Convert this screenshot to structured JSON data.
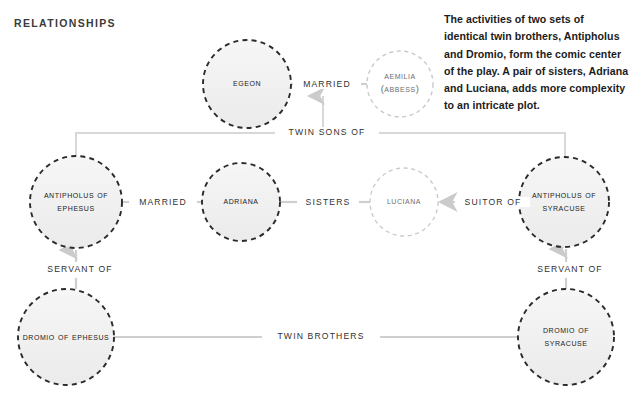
{
  "page": {
    "title": "RELATIONSHIPS",
    "background": "#ffffff",
    "width": 634,
    "height": 397
  },
  "blurb": {
    "text": "The activities of two sets of identical twin brothers, Antipholus and Dromio, form the comic center of the play. A pair of sisters, Adriana and Luciana, adds more complexity to an intricate plot."
  },
  "colors": {
    "node_fill": "#f1f1f1",
    "node_stroke_strong": "#2b2b2b",
    "node_stroke_faint": "#c9c9c9",
    "edge_stroke": "#cfcfcf",
    "text": "#222222",
    "text_faint": "#6d6d6d"
  },
  "nodes": [
    {
      "id": "egeon",
      "label": "Egeon",
      "lines": [
        "Egeon"
      ],
      "cx": 247,
      "cy": 84,
      "r": 44,
      "style": "strong"
    },
    {
      "id": "aemilia",
      "label": "Aemilia (Abbess)",
      "lines": [
        "Aemilia",
        "(Abbess)"
      ],
      "cx": 400,
      "cy": 84,
      "r": 33,
      "style": "faint"
    },
    {
      "id": "antipholus-ephesus",
      "label": "Antipholus of Ephesus",
      "lines": [
        "Antipholus of",
        "Ephesus"
      ],
      "cx": 76,
      "cy": 202,
      "r": 46,
      "style": "strong"
    },
    {
      "id": "adriana",
      "label": "Adriana",
      "lines": [
        "Adriana"
      ],
      "cx": 241,
      "cy": 202,
      "r": 39,
      "style": "strong"
    },
    {
      "id": "luciana",
      "label": "Luciana",
      "lines": [
        "Luciana"
      ],
      "cx": 404,
      "cy": 202,
      "r": 34,
      "style": "faint"
    },
    {
      "id": "antipholus-syracuse",
      "label": "Antipholus of Syracuse",
      "lines": [
        "Antipholus of",
        "Syracuse"
      ],
      "cx": 564,
      "cy": 202,
      "r": 45,
      "style": "strong"
    },
    {
      "id": "dromio-ephesus",
      "label": "Dromio of Ephesus",
      "lines": [
        "Dromio of Ephesus"
      ],
      "cx": 66,
      "cy": 337,
      "r": 48,
      "style": "strong"
    },
    {
      "id": "dromio-syracuse",
      "label": "Dromio of Syracuse",
      "lines": [
        "Dromio of",
        "Syracuse"
      ],
      "cx": 566,
      "cy": 337,
      "r": 48,
      "style": "strong"
    }
  ],
  "edges": [
    {
      "id": "married-top",
      "label": "MARRIED",
      "from": "egeon",
      "to": "aemilia",
      "label_x": 323,
      "label_y": 84
    },
    {
      "id": "twin-sons-of",
      "label": "TWIN SONS OF",
      "from": "bracket",
      "to": "egeon-aemilia",
      "label_x": 323,
      "label_y": 133
    },
    {
      "id": "married-mid",
      "label": "MARRIED",
      "from": "antipholus-ephesus",
      "to": "adriana",
      "label_x": 159,
      "label_y": 202
    },
    {
      "id": "sisters",
      "label": "SISTERS",
      "from": "adriana",
      "to": "luciana",
      "label_x": 324,
      "label_y": 202
    },
    {
      "id": "suitor-of",
      "label": "SUITOR OF",
      "from": "antipholus-syracuse",
      "to": "luciana",
      "label_x": 489,
      "label_y": 202
    },
    {
      "id": "servant-of-left",
      "label": "SERVANT OF",
      "from": "dromio-ephesus",
      "to": "antipholus-ephesus",
      "label_x": 76,
      "label_y": 270
    },
    {
      "id": "servant-of-right",
      "label": "SERVANT OF",
      "from": "dromio-syracuse",
      "to": "antipholus-syracuse",
      "label_x": 566,
      "label_y": 270
    },
    {
      "id": "twin-brothers",
      "label": "TWIN BROTHERS",
      "from": "dromio-ephesus",
      "to": "dromio-syracuse",
      "label_x": 316,
      "label_y": 337
    }
  ]
}
